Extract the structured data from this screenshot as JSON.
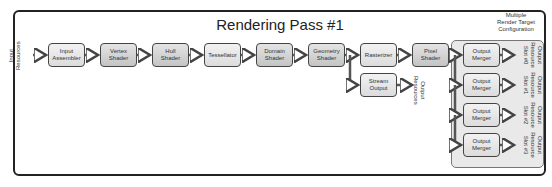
{
  "title": "Rendering Pass #1",
  "input_label": "Input\nResources",
  "stages": [
    {
      "id": "input-assembler",
      "label": "Input\nAssembler"
    },
    {
      "id": "vertex-shader",
      "label": "Vertex\nShader"
    },
    {
      "id": "hull-shader",
      "label": "Hull\nShader"
    },
    {
      "id": "tessellator",
      "label": "Tessellator"
    },
    {
      "id": "domain-shader",
      "label": "Domain\nShader"
    },
    {
      "id": "geometry-shader",
      "label": "Geometry\nShader"
    },
    {
      "id": "rasterizer",
      "label": "Rasterizer"
    },
    {
      "id": "pixel-shader",
      "label": "Pixel\nShader"
    }
  ],
  "stream_output": {
    "label": "Stream\nOutput",
    "output_label": "Output\nResources"
  },
  "mrt": {
    "label": "Multiple\nRender Target\nConfiguration",
    "mergers": [
      {
        "label": "Output\nMerger",
        "slot_label": "Output\nResource\nSlot #0"
      },
      {
        "label": "Output\nMerger",
        "slot_label": "Output\nResource\nSlot #1"
      },
      {
        "label": "Output\nMerger",
        "slot_label": "Output\nResource\nSlot #2"
      },
      {
        "label": "Output\nMerger",
        "slot_label": "Output\nResource\nSlot #3"
      }
    ]
  }
}
